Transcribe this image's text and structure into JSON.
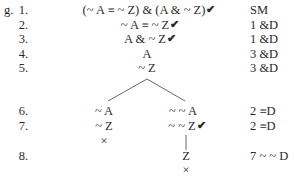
{
  "problem_label": "g.",
  "check_mark": "✔",
  "close_mark": "×",
  "trunk": [
    {
      "n": "1.",
      "formula": "(~ A ≡ ~ Z) & (A & ~ Z)",
      "checked": true,
      "just": "SM"
    },
    {
      "n": "2.",
      "formula": "~ A ≡ ~ Z",
      "checked": true,
      "just": "1 &D"
    },
    {
      "n": "3.",
      "formula": "A & ~ Z",
      "checked": true,
      "just": "1 &D"
    },
    {
      "n": "4.",
      "formula": "A",
      "checked": false,
      "just": "3 &D"
    },
    {
      "n": "5.",
      "formula": "~ Z",
      "checked": false,
      "just": "3 &D"
    }
  ],
  "branches": {
    "left": [
      {
        "n": "6.",
        "formula": "~ A"
      },
      {
        "n": "7.",
        "formula": "~ Z"
      }
    ],
    "right": [
      {
        "formula": "~ ~ A"
      },
      {
        "formula": "~ ~ Z",
        "checked": true
      },
      {
        "n": "8.",
        "formula": "Z"
      }
    ],
    "left_closed": true,
    "right_closed": true
  },
  "justifications_lower": [
    {
      "row": "6.",
      "just": "2 ≡D"
    },
    {
      "row": "7.",
      "just": "2 ≡D"
    },
    {
      "row": "8.",
      "just": "7 ~ ~ D"
    }
  ]
}
